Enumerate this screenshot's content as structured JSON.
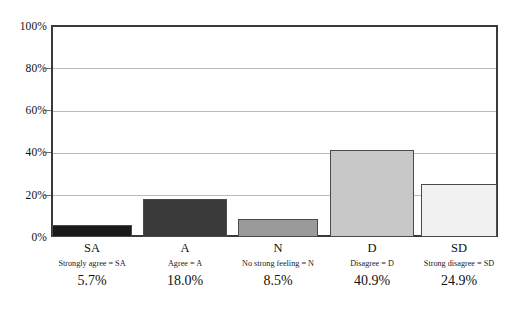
{
  "chart_data": {
    "type": "bar",
    "title": "",
    "subtitle": "",
    "xlabel": "",
    "ylabel": "",
    "categories": [
      "SA",
      "A",
      "N",
      "D",
      "SD"
    ],
    "category_legends": [
      "Strongly agree = SA",
      "Agree = A",
      "No strong feeling = N",
      "Disagree = D",
      "Strong disagree = SD"
    ],
    "value_labels": [
      "5.7%",
      "18.0%",
      "8.5%",
      "40.9%",
      "24.9%"
    ],
    "values": [
      5.7,
      18.0,
      8.5,
      40.9,
      24.9
    ],
    "ylim": [
      0,
      100
    ],
    "yticks": [
      0,
      20,
      40,
      60,
      80,
      100
    ],
    "ytick_labels": [
      "0%",
      "20%",
      "40%",
      "60%",
      "80%",
      "100%"
    ],
    "grid": true,
    "legend_position": "none",
    "bar_colors": [
      "#1a1a1a",
      "#3a3a3a",
      "#9a9a9a",
      "#c8c8c8",
      "#f1f1f1"
    ],
    "bar_border_color": "#4a4a4a",
    "gridline_color": "#b9b9b9",
    "frame_color": "#3a3a3a"
  }
}
